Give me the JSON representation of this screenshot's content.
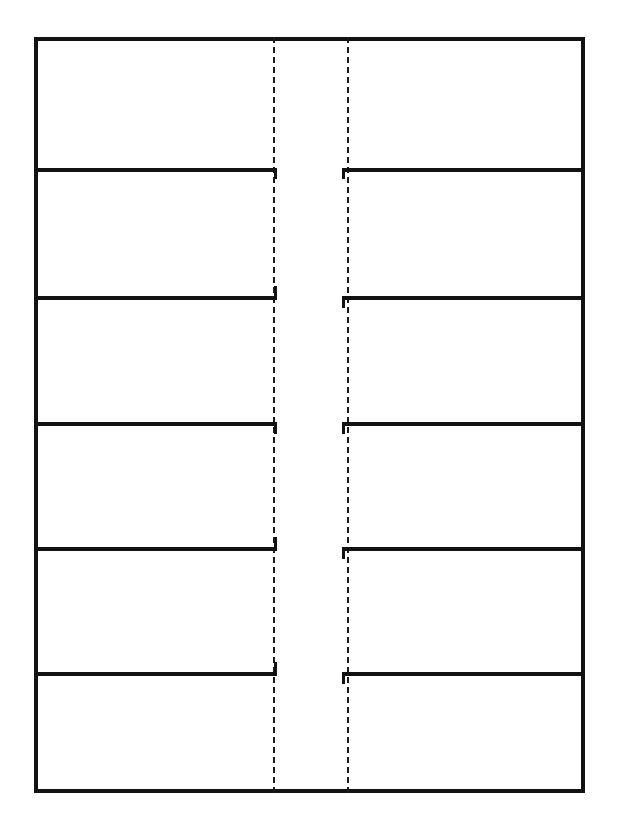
{
  "document": {
    "kind": "blank-template-sheet",
    "orientation": "portrait",
    "background_color": "#ffffff",
    "ink_color": "#121212",
    "fold_line_color": "#1a1a1a"
  },
  "sheet": {
    "frame": {
      "left": 34,
      "top": 37,
      "right": 585,
      "bottom": 793,
      "stroke_width": 4
    },
    "fold_lines": {
      "style": "dashed",
      "count": 2,
      "x_positions": [
        273,
        347
      ],
      "dash_length": 6,
      "gap_length": 5,
      "stroke_width": 2
    },
    "row_dividers_y": [
      168,
      296,
      422,
      547,
      672
    ],
    "rows": [
      {
        "index": 1,
        "label": "",
        "split": false,
        "top": 37,
        "bottom": 168
      },
      {
        "index": 2,
        "label": "",
        "split": true,
        "top": 168,
        "bottom": 296
      },
      {
        "index": 3,
        "label": "",
        "split": true,
        "top": 296,
        "bottom": 422
      },
      {
        "index": 4,
        "label": "",
        "split": true,
        "top": 422,
        "bottom": 547
      },
      {
        "index": 5,
        "label": "",
        "split": true,
        "top": 547,
        "bottom": 672
      },
      {
        "index": 6,
        "label": "",
        "split": true,
        "top": 672,
        "bottom": 793
      }
    ],
    "cells": [
      {
        "row": 1,
        "side": "full",
        "text": ""
      },
      {
        "row": 2,
        "side": "left",
        "text": ""
      },
      {
        "row": 2,
        "side": "right",
        "text": ""
      },
      {
        "row": 3,
        "side": "left",
        "text": ""
      },
      {
        "row": 3,
        "side": "right",
        "text": ""
      },
      {
        "row": 4,
        "side": "left",
        "text": ""
      },
      {
        "row": 4,
        "side": "right",
        "text": ""
      },
      {
        "row": 5,
        "side": "left",
        "text": ""
      },
      {
        "row": 5,
        "side": "right",
        "text": ""
      },
      {
        "row": 6,
        "side": "left",
        "text": ""
      },
      {
        "row": 6,
        "side": "right",
        "text": ""
      }
    ]
  },
  "margins": {
    "top_artifact_text": "",
    "bottom_artifact_text": ""
  }
}
